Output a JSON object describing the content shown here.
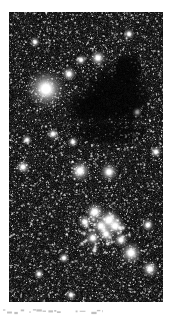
{
  "figure": {
    "kind": "astronomical-photograph",
    "medium": "black-and-white photographic plate reproduction",
    "plate": {
      "left": 9,
      "top": 12,
      "width": 154,
      "height": 290,
      "background_color": "#000000",
      "star_color": "#ffffff",
      "orientation": "portrait"
    },
    "caption_text": "",
    "caption_note": "clipped illegible scan line beneath the plate"
  },
  "chart_data": {
    "type": "scatter",
    "title": "",
    "subtitle": "",
    "xlabel": "",
    "ylabel": "",
    "xlim": [
      0,
      154
    ],
    "ylim": [
      0,
      290
    ],
    "grid": false,
    "legend_position": "none",
    "tick_labels": {
      "x": [],
      "y": []
    },
    "annotations": [],
    "background": "#000000",
    "point_color": "#ffffff",
    "field": {
      "star_count_estimate": 5200,
      "background_density": "very high",
      "noise_grain": "photographic emulsion grain"
    },
    "features": [
      {
        "name": "dark-nebula",
        "type": "absorption-cloud",
        "shape": "irregular lobed blob with a narrow tail toward upper right",
        "center": [
          107,
          85
        ],
        "radius_x": 34,
        "radius_y": 30,
        "opacity": 0.96,
        "star_suppression": 0.93
      },
      {
        "name": "dark-nebula-lobe-upper",
        "type": "absorption-cloud",
        "center": [
          118,
          58
        ],
        "radius_x": 15,
        "radius_y": 16,
        "opacity": 0.9,
        "star_suppression": 0.85
      },
      {
        "name": "dark-nebula-lobe-west",
        "type": "absorption-cloud",
        "center": [
          82,
          96
        ],
        "radius_x": 22,
        "radius_y": 17,
        "opacity": 0.85,
        "star_suppression": 0.8
      },
      {
        "name": "dark-lane-lower",
        "type": "absorption-lane",
        "center": [
          100,
          120
        ],
        "radius_x": 40,
        "radius_y": 13,
        "opacity": 0.6,
        "star_suppression": 0.5
      },
      {
        "name": "open-cluster",
        "type": "star-cluster",
        "center": [
          94,
          218
        ],
        "radius": 27,
        "member_count": 48,
        "concentration": "moderate",
        "brightest_members": 14
      }
    ],
    "bright_stars": [
      {
        "x": 37,
        "y": 77,
        "magnitude_size": 11.0,
        "label": ""
      },
      {
        "x": 60,
        "y": 62,
        "magnitude_size": 4.2,
        "label": ""
      },
      {
        "x": 89,
        "y": 46,
        "magnitude_size": 4.6,
        "label": ""
      },
      {
        "x": 72,
        "y": 48,
        "magnitude_size": 3.2,
        "label": ""
      },
      {
        "x": 44,
        "y": 122,
        "magnitude_size": 3.4,
        "label": ""
      },
      {
        "x": 64,
        "y": 130,
        "magnitude_size": 3.0,
        "label": ""
      },
      {
        "x": 71,
        "y": 159,
        "magnitude_size": 6.0,
        "label": ""
      },
      {
        "x": 100,
        "y": 160,
        "magnitude_size": 5.2,
        "label": ""
      },
      {
        "x": 14,
        "y": 155,
        "magnitude_size": 4.0,
        "label": ""
      },
      {
        "x": 18,
        "y": 128,
        "magnitude_size": 3.0,
        "label": ""
      },
      {
        "x": 86,
        "y": 200,
        "magnitude_size": 5.6,
        "label": ""
      },
      {
        "x": 100,
        "y": 208,
        "magnitude_size": 6.4,
        "label": ""
      },
      {
        "x": 106,
        "y": 214,
        "magnitude_size": 5.8,
        "label": ""
      },
      {
        "x": 92,
        "y": 214,
        "magnitude_size": 5.0,
        "label": ""
      },
      {
        "x": 97,
        "y": 222,
        "magnitude_size": 4.6,
        "label": ""
      },
      {
        "x": 84,
        "y": 226,
        "magnitude_size": 4.4,
        "label": ""
      },
      {
        "x": 76,
        "y": 210,
        "magnitude_size": 4.0,
        "label": ""
      },
      {
        "x": 112,
        "y": 228,
        "magnitude_size": 4.2,
        "label": ""
      },
      {
        "x": 122,
        "y": 241,
        "magnitude_size": 6.2,
        "label": ""
      },
      {
        "x": 141,
        "y": 257,
        "magnitude_size": 4.8,
        "label": ""
      },
      {
        "x": 139,
        "y": 213,
        "magnitude_size": 3.6,
        "label": ""
      },
      {
        "x": 55,
        "y": 246,
        "magnitude_size": 3.2,
        "label": ""
      },
      {
        "x": 30,
        "y": 262,
        "magnitude_size": 3.0,
        "label": ""
      },
      {
        "x": 128,
        "y": 100,
        "magnitude_size": 2.8,
        "label": ""
      },
      {
        "x": 26,
        "y": 30,
        "magnitude_size": 3.0,
        "label": ""
      },
      {
        "x": 120,
        "y": 22,
        "magnitude_size": 3.2,
        "label": ""
      },
      {
        "x": 147,
        "y": 140,
        "magnitude_size": 3.4,
        "label": ""
      },
      {
        "x": 62,
        "y": 283,
        "magnitude_size": 3.0,
        "label": ""
      }
    ]
  }
}
